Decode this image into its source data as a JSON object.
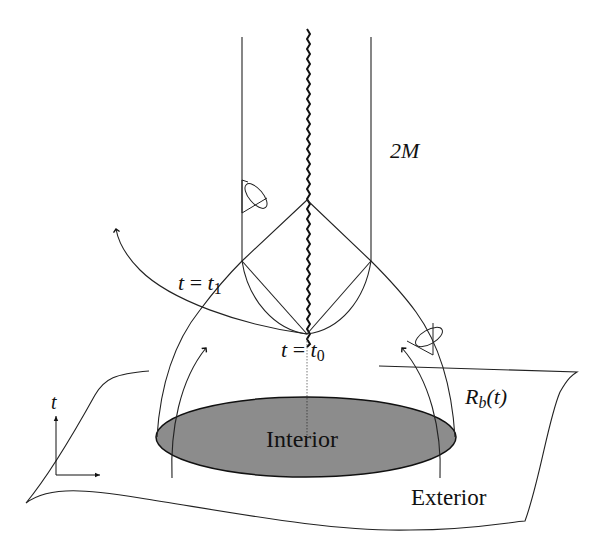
{
  "figure": {
    "labels": {
      "horizon": "2M",
      "t1_var": "t",
      "t1_eq": " = ",
      "t1_sym": "t",
      "t1_sub": "1",
      "t0_var": "t",
      "t0_eq": " = ",
      "t0_sym": "t",
      "t0_sub": "0",
      "rb_sym": "R",
      "rb_sub": "b",
      "rb_arg": "(t)",
      "axis_t": "t",
      "interior": "Interior",
      "exterior": "Exterior"
    },
    "colors": {
      "interior_fill": "#8c8c8c",
      "line": "#222222",
      "background": "#ffffff"
    }
  }
}
